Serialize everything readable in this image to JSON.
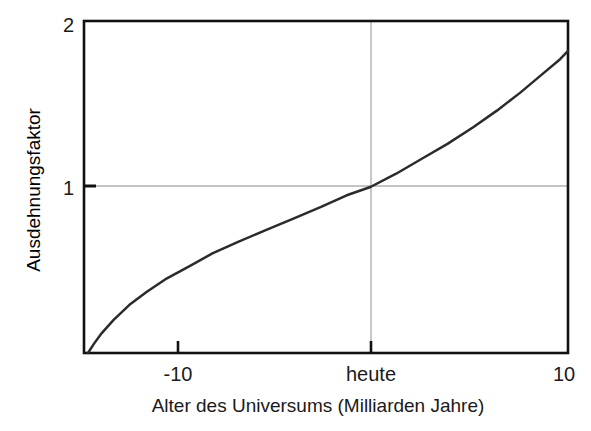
{
  "figure": {
    "name": "expansion-factor-vs-universe-age",
    "background_color": "#ffffff"
  },
  "chart_data": {
    "type": "line",
    "title": "",
    "subtitle": "",
    "xlabel": "Alter des Universums (Milliarden Jahre)",
    "ylabel": "Ausdehnungsfaktor",
    "xlim": [
      -14.5,
      10
    ],
    "ylim": [
      0.0,
      2.0
    ],
    "grid": true,
    "grid_color": "#b3b3b3",
    "legend": null,
    "legend_position": "none",
    "xticks": [
      -10,
      0,
      10
    ],
    "xticklabels": [
      "-10",
      "heute",
      "10"
    ],
    "yticks": [
      1,
      2
    ],
    "yticklabels": [
      "1",
      "2"
    ],
    "series": [
      {
        "name": "Ausdehnungsfaktor",
        "color": "#2b2b2b",
        "linewidth": 2.5,
        "x": [
          -14.3,
          -14.0,
          -13.6,
          -13.0,
          -12.2,
          -11.3,
          -10.3,
          -9.2,
          -8.0,
          -6.7,
          -5.3,
          -3.9,
          -2.5,
          -1.2,
          0.0,
          1.3,
          2.6,
          3.9,
          5.2,
          6.4,
          7.6,
          8.7,
          9.6,
          10.0
        ],
        "y": [
          0.0,
          0.055,
          0.12,
          0.2,
          0.29,
          0.37,
          0.45,
          0.52,
          0.6,
          0.67,
          0.74,
          0.81,
          0.88,
          0.95,
          1.0,
          1.08,
          1.17,
          1.26,
          1.36,
          1.46,
          1.57,
          1.68,
          1.77,
          1.82
        ]
      }
    ],
    "annotations": [
      {
        "name": "today-gridline",
        "type": "vline",
        "x": 0,
        "color": "#b3b3b3"
      },
      {
        "name": "unity-gridline",
        "type": "hline",
        "y": 1,
        "color": "#b3b3b3"
      }
    ]
  },
  "axes": {
    "frame_color": "#111111",
    "y_title": "Ausdehnungsfaktor",
    "x_title": "Alter des Universums (Milliarden Jahre)",
    "y_tick_top": "2",
    "y_tick_mid": "1",
    "x_tick_left": "-10",
    "x_tick_mid": "heute",
    "x_tick_right": "10"
  }
}
